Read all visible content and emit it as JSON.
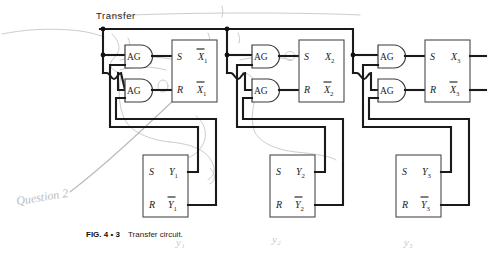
{
  "figure": {
    "title_label": "Transfer",
    "caption_prefix": "FIG. 4 • 3",
    "caption_text": "Transfer circuit.",
    "colors": {
      "wire": "#1a1a1a",
      "box_outline": "#4a4a4a",
      "gate_outline": "#3a3a3a",
      "pencil": "#bdbdbd",
      "background": "#ffffff"
    }
  },
  "gates": {
    "and_label": "AG",
    "count": 6,
    "items": [
      {
        "name": "and-gate-1-set",
        "label": "AG",
        "stage": 1,
        "role": "set"
      },
      {
        "name": "and-gate-1-reset",
        "label": "AG",
        "stage": 1,
        "role": "reset"
      },
      {
        "name": "and-gate-2-set",
        "label": "AG",
        "stage": 2,
        "role": "set"
      },
      {
        "name": "and-gate-2-reset",
        "label": "AG",
        "stage": 2,
        "role": "reset"
      },
      {
        "name": "and-gate-3-set",
        "label": "AG",
        "stage": 3,
        "role": "set"
      },
      {
        "name": "and-gate-3-reset",
        "label": "AG",
        "stage": 3,
        "role": "reset"
      }
    ]
  },
  "flipflops": {
    "input_set": "S",
    "input_reset": "R",
    "x_stages": [
      {
        "name": "flipflop-x1",
        "q": "X",
        "qbar": "X",
        "index": "1"
      },
      {
        "name": "flipflop-x2",
        "q": "X",
        "qbar": "X",
        "index": "2"
      },
      {
        "name": "flipflop-x3",
        "q": "X",
        "qbar": "X",
        "index": "3"
      }
    ],
    "y_stages": [
      {
        "name": "flipflop-y1",
        "q": "Y",
        "qbar": "Y",
        "index": "1"
      },
      {
        "name": "flipflop-y2",
        "q": "Y",
        "qbar": "Y",
        "index": "2"
      },
      {
        "name": "flipflop-y3",
        "q": "Y",
        "qbar": "Y",
        "index": "3"
      }
    ]
  },
  "annotations": {
    "question_note": "Question 2",
    "pencil_y1": "y₁",
    "pencil_y2": "y₂",
    "pencil_y3": "y₃"
  }
}
